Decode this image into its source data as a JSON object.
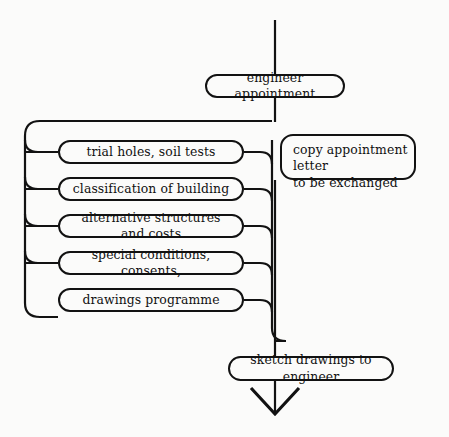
{
  "diagram": {
    "style": {
      "background": "#fbfbfa",
      "line_color": "#121212",
      "text_color": "#111111"
    },
    "nodes": {
      "engineer_appointment": {
        "label": "engineer appointment",
        "shape": "stadium"
      },
      "copy_appointment_letter": {
        "label": "copy appointment letter\nto be exchanged",
        "shape": "rounded-rect"
      },
      "trial_holes": {
        "label": "trial holes, soil tests",
        "shape": "stadium"
      },
      "classification": {
        "label": "classification of building",
        "shape": "stadium"
      },
      "alternative_structures": {
        "label": "alternative structures and costs",
        "shape": "stadium"
      },
      "special_conditions": {
        "label": "special conditions, consents,",
        "shape": "stadium"
      },
      "drawings_programme": {
        "label": "drawings programme",
        "shape": "stadium"
      },
      "sketch_drawings": {
        "label": "sketch drawings to engineer",
        "shape": "stadium"
      }
    },
    "connectors": {
      "trunk_top": "vertical line from top edge into engineer appointment",
      "left_collector": "left spine bracket gathering five task nodes",
      "right_collector": "right spine returning to main trunk",
      "arrow_out": "downward open arrowhead at bottom of trunk"
    }
  }
}
